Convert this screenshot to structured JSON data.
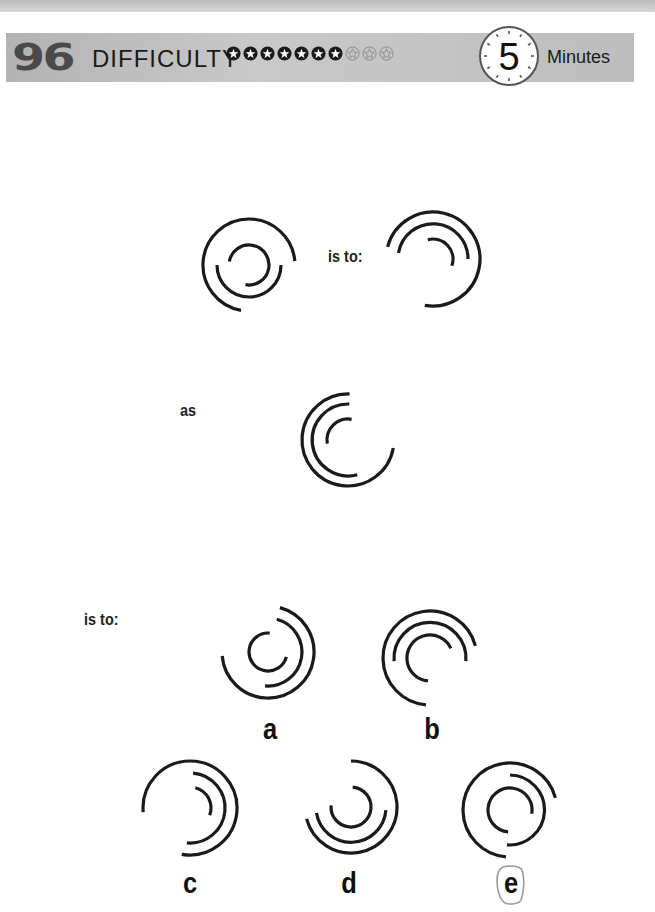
{
  "header": {
    "puzzle_number": "96",
    "difficulty_label": "DIFFICULTY",
    "difficulty_filled": 7,
    "difficulty_total": 10,
    "timer_value": "5",
    "timer_unit": "Minutes"
  },
  "question": {
    "connector_1": "is to:",
    "connector_2": "as",
    "connector_3": "is to:"
  },
  "options": [
    {
      "label": "a",
      "selected": false
    },
    {
      "label": "b",
      "selected": false
    },
    {
      "label": "c",
      "selected": false
    },
    {
      "label": "d",
      "selected": false
    },
    {
      "label": "e",
      "selected": true
    }
  ],
  "figures": {
    "stroke_color": "#1a1a1a",
    "selection_outline_color": "#9a9a9a"
  }
}
